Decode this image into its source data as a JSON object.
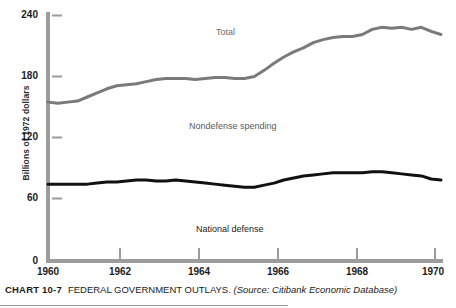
{
  "chart_data": {
    "type": "line",
    "title": "FEDERAL GOVERNMENT OUTLAYS.",
    "chart_number": "CHART 10-7",
    "source": "(Source: Citibank Economic Database)",
    "xlabel": "",
    "ylabel": "Billions of 1972 dollars",
    "xlim": [
      1960,
      1970
    ],
    "ylim": [
      0,
      260
    ],
    "y_ticks": [
      0,
      60,
      120,
      180,
      240
    ],
    "x_ticks": [
      1960,
      1962,
      1964,
      1966,
      1968,
      1970
    ],
    "grid": false,
    "legend": "in-plot labels",
    "annotations": [
      {
        "text": "Total",
        "x": 1964.4,
        "y": 238
      },
      {
        "text": "Nondefense spending",
        "x": 1963.6,
        "y": 144
      },
      {
        "text": "National defense",
        "x": 1963.8,
        "y": 40
      }
    ],
    "series": [
      {
        "name": "Total",
        "color": "#7a7a7a",
        "x": [
          1960.0,
          1960.25,
          1960.5,
          1960.75,
          1961.0,
          1961.25,
          1961.5,
          1961.75,
          1962.0,
          1962.25,
          1962.5,
          1962.75,
          1963.0,
          1963.25,
          1963.5,
          1963.75,
          1964.0,
          1964.25,
          1964.5,
          1964.75,
          1965.0,
          1965.25,
          1965.5,
          1965.75,
          1966.0,
          1966.25,
          1966.5,
          1966.75,
          1967.0,
          1967.25,
          1967.5,
          1967.75,
          1968.0,
          1968.25,
          1968.5,
          1968.75,
          1969.0,
          1969.25,
          1969.5,
          1969.75,
          1970.0
        ],
        "values": [
          155,
          154,
          155,
          156,
          160,
          164,
          168,
          171,
          172,
          173,
          175,
          177,
          178,
          178,
          178,
          177,
          178,
          179,
          179,
          178,
          178,
          180,
          186,
          193,
          199,
          204,
          208,
          213,
          216,
          218,
          219,
          219,
          221,
          226,
          228,
          227,
          228,
          226,
          228,
          224,
          221
        ]
      },
      {
        "name": "National defense",
        "color": "#111111",
        "x": [
          1960.0,
          1960.25,
          1960.5,
          1960.75,
          1961.0,
          1961.25,
          1961.5,
          1961.75,
          1962.0,
          1962.25,
          1962.5,
          1962.75,
          1963.0,
          1963.25,
          1963.5,
          1963.75,
          1964.0,
          1964.25,
          1964.5,
          1964.75,
          1965.0,
          1965.25,
          1965.5,
          1965.75,
          1966.0,
          1966.25,
          1966.5,
          1966.75,
          1967.0,
          1967.25,
          1967.5,
          1967.75,
          1968.0,
          1968.25,
          1968.5,
          1968.75,
          1969.0,
          1969.25,
          1969.5,
          1969.75,
          1970.0
        ],
        "values": [
          75,
          75,
          75,
          75,
          75,
          76,
          77,
          77,
          78,
          79,
          79,
          78,
          78,
          79,
          78,
          77,
          76,
          75,
          74,
          73,
          72,
          72,
          74,
          76,
          79,
          81,
          83,
          84,
          85,
          86,
          86,
          86,
          86,
          87,
          87,
          86,
          85,
          84,
          83,
          80,
          79
        ]
      }
    ],
    "implied_series_note": "Nondefense spending is the gap between the Total and National defense curves"
  },
  "axis": {
    "y_title": "Billions of 1972 dollars",
    "y_ticks": [
      "240",
      "180",
      "120",
      "60",
      "0"
    ],
    "x_ticks": [
      "1960",
      "1962",
      "1964",
      "1966",
      "1968",
      "1970"
    ]
  },
  "labels": {
    "total": "Total",
    "nondefense": "Nondefense spending",
    "defense": "National defense"
  },
  "caption": {
    "number": "CHART 10-7",
    "title": "FEDERAL GOVERNMENT OUTLAYS.",
    "source": "(Source: Citibank Economic Database)"
  },
  "colors": {
    "total_line": "#7a7a7a",
    "defense_line": "#111111",
    "axis": "#9c9c9c",
    "text": "#1c1c1c"
  }
}
